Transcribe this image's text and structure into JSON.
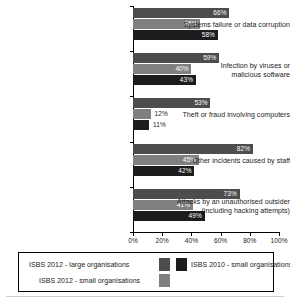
{
  "chart_data": {
    "type": "bar",
    "orientation": "horizontal",
    "title": "",
    "xlabel": "",
    "ylabel": "",
    "xlim": [
      0,
      100
    ],
    "xticks": [
      "0%",
      "20%",
      "40%",
      "60%",
      "80%",
      "100%"
    ],
    "xtick_values": [
      0,
      20,
      40,
      60,
      80,
      100
    ],
    "grid": false,
    "legend_position": "bottom",
    "categories": [
      "Systems failure or data corruption",
      "Infection by viruses or malicious software",
      "Theft or fraud involving computers",
      "Other incidents caused by staff",
      "Attacks by an unauthorised outsider (including hacking attempts)"
    ],
    "series": [
      {
        "name": "ISBS 2012 - large organisations",
        "color": "#4d4d4d",
        "values": [
          66,
          59,
          53,
          82,
          73
        ],
        "labels": [
          "66%",
          "59%",
          "53%",
          "82%",
          "73%"
        ]
      },
      {
        "name": "ISBS 2012 - small organisations",
        "color": "#808080",
        "values": [
          46,
          40,
          12,
          45,
          41
        ],
        "labels": [
          "46%",
          "40%",
          "12%",
          "45%",
          "41%"
        ]
      },
      {
        "name": "ISBS 2010 - small organisations",
        "color": "#1c1c1c",
        "values": [
          58,
          43,
          11,
          42,
          49
        ],
        "labels": [
          "58%",
          "43%",
          "11%",
          "42%",
          "49%"
        ]
      }
    ]
  },
  "categories_display": [
    {
      "line1": "Systems failure or data corruption",
      "line2": ""
    },
    {
      "line1": "Infection by viruses or",
      "line2": "malicious software"
    },
    {
      "line1": "Theft or fraud involving computers",
      "line2": ""
    },
    {
      "line1": "Other incidents caused by staff",
      "line2": ""
    },
    {
      "line1": "Attacks by an unauthorised outsider",
      "line2": "(including hacking attempts)"
    }
  ],
  "legend": {
    "entries": [
      {
        "label": "ISBS 2012 - large organisations",
        "color": "#4d4d4d"
      },
      {
        "label": "ISBS 2010 - small organisations",
        "color": "#1c1c1c"
      },
      {
        "label": "ISBS 2012 - small organisations",
        "color": "#808080"
      }
    ]
  }
}
